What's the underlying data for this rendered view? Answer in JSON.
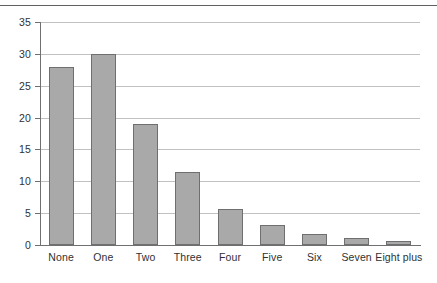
{
  "chart_data": {
    "type": "bar",
    "title": "",
    "subtitle": "",
    "xlabel": "",
    "ylabel": "",
    "categories": [
      "None",
      "One",
      "Two",
      "Three",
      "Four",
      "Five",
      "Six",
      "Seven",
      "Eight plus"
    ],
    "values": [
      28,
      30,
      19,
      11.5,
      5.7,
      3.2,
      1.7,
      1.1,
      0.7
    ],
    "ylim": [
      0,
      35
    ],
    "yticks": [
      0,
      5,
      10,
      15,
      20,
      25,
      30,
      35
    ],
    "ytick_labels": [
      "0",
      "5",
      "10",
      "15",
      "20",
      "25",
      "30",
      "35"
    ],
    "grid": true,
    "grid_axis": "y",
    "legend": false,
    "legend_position": "none",
    "annotations": [],
    "colors": {
      "bar_fill": "#a9a9a9",
      "bar_border": "#6d6f71",
      "gridline": "#bfc1c3",
      "axis": "#6e7072",
      "text": "#2f3133",
      "top_rule": "#5f6163",
      "background": "#ffffff"
    }
  }
}
